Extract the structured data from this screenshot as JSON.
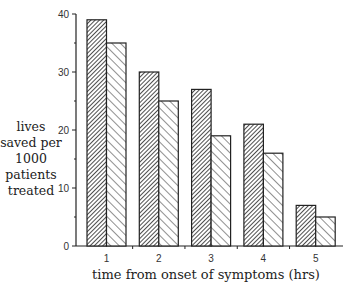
{
  "chart_data": {
    "type": "bar",
    "title": "",
    "xlabel": "time from onset of symptoms (hrs)",
    "ylabel": "lives saved per 1000 patients treated",
    "ylabel_lines": [
      "lives",
      "saved per",
      "1000",
      "patients",
      "treated"
    ],
    "categories": [
      "1",
      "2",
      "3",
      "4",
      "5"
    ],
    "series": [
      {
        "name": "dense hatch",
        "pattern": "dense-diagonal",
        "values": [
          39,
          30,
          27,
          21,
          7
        ]
      },
      {
        "name": "sparse hatch",
        "pattern": "sparse-diagonal",
        "values": [
          35,
          25,
          19,
          16,
          5
        ]
      }
    ],
    "ylim": [
      0,
      40
    ],
    "yticks": [
      0,
      10,
      20,
      30,
      40
    ],
    "yticks_minor": [
      5,
      15,
      25,
      35
    ],
    "grid": false,
    "legend": null
  }
}
